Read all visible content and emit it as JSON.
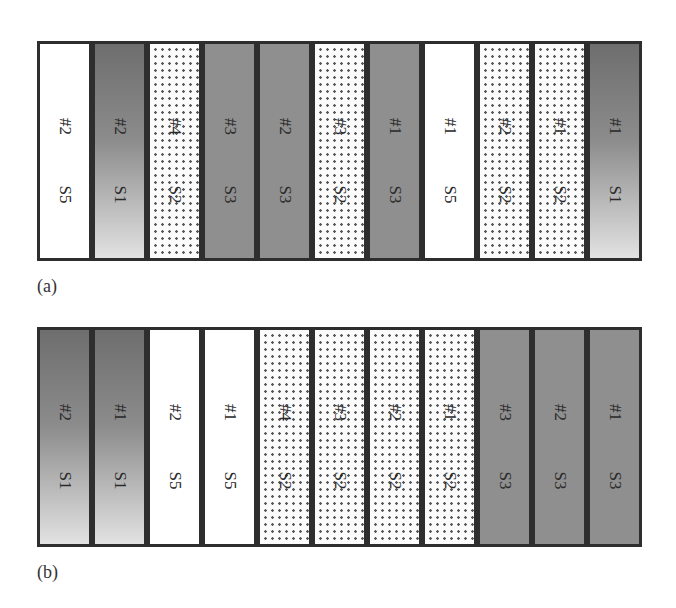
{
  "figure": {
    "panels": [
      {
        "caption": "(a)",
        "boxes": [
          {
            "num": "#2",
            "s": "S5",
            "fill": "white"
          },
          {
            "num": "#2",
            "s": "S1",
            "fill": "gradient"
          },
          {
            "num": "#4",
            "s": "S2",
            "fill": "dots"
          },
          {
            "num": "#3",
            "s": "S3",
            "fill": "solid"
          },
          {
            "num": "#2",
            "s": "S3",
            "fill": "solid"
          },
          {
            "num": "#3",
            "s": "S2",
            "fill": "dots"
          },
          {
            "num": "#1",
            "s": "S3",
            "fill": "solid"
          },
          {
            "num": "#1",
            "s": "S5",
            "fill": "white"
          },
          {
            "num": "#2",
            "s": "S2",
            "fill": "dots"
          },
          {
            "num": "#1",
            "s": "S2",
            "fill": "dots"
          },
          {
            "num": "#1",
            "s": "S1",
            "fill": "gradient"
          }
        ]
      },
      {
        "caption": "(b)",
        "boxes": [
          {
            "num": "#2",
            "s": "S1",
            "fill": "gradient"
          },
          {
            "num": "#1",
            "s": "S1",
            "fill": "gradient"
          },
          {
            "num": "#2",
            "s": "S5",
            "fill": "white"
          },
          {
            "num": "#1",
            "s": "S5",
            "fill": "white"
          },
          {
            "num": "#4",
            "s": "S2",
            "fill": "dots"
          },
          {
            "num": "#3",
            "s": "S2",
            "fill": "dots"
          },
          {
            "num": "#2",
            "s": "S2",
            "fill": "dots"
          },
          {
            "num": "#1",
            "s": "S2",
            "fill": "dots"
          },
          {
            "num": "#3",
            "s": "S3",
            "fill": "solid"
          },
          {
            "num": "#2",
            "s": "S3",
            "fill": "solid"
          },
          {
            "num": "#1",
            "s": "S3",
            "fill": "solid"
          }
        ]
      }
    ],
    "colors": {
      "border": "#2e2e2e",
      "solid": "#8f8f8f",
      "gradient_top": "#6e6e6e",
      "gradient_bottom": "#e2e2e2",
      "dots": "#5a5a5a"
    }
  }
}
